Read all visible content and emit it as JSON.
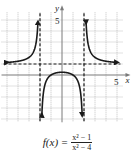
{
  "chart_data": {
    "type": "line",
    "function": "(x^2-1)/(x^2-4)",
    "xlabel": "x",
    "ylabel": "y",
    "xlim": [
      -5.5,
      5.5
    ],
    "ylim": [
      -4.3,
      5.7
    ],
    "tick_labels": {
      "x": [
        "5"
      ],
      "y": [
        "5"
      ]
    },
    "grid": true,
    "grid_step": 1,
    "asymptotes": {
      "vertical": [
        -2,
        2
      ],
      "horizontal": [
        1
      ]
    },
    "branches": [
      {
        "name": "left",
        "x_range": [
          -5.5,
          -2.05
        ],
        "end_arrows": true
      },
      {
        "name": "middle",
        "x_range": [
          -1.95,
          1.95
        ],
        "end_arrows": true
      },
      {
        "name": "right",
        "x_range": [
          2.05,
          5.5
        ],
        "end_arrows": true
      }
    ],
    "key_points": [
      {
        "x": 0,
        "y": 0.25
      },
      {
        "x": -1,
        "y": 0
      },
      {
        "x": 1,
        "y": 0
      }
    ]
  },
  "labels": {
    "x_axis": "x",
    "y_axis": "y",
    "x_tick": "5",
    "y_tick": "5",
    "caption_lhs": "f(x) =",
    "caption_num": "x² − 1",
    "caption_den": "x² − 4"
  },
  "colors": {
    "curve": "#1a1a1a",
    "grid": "#9a9a9a",
    "axis": "#7a7a7a",
    "asymptote": "#1a1a1a"
  }
}
